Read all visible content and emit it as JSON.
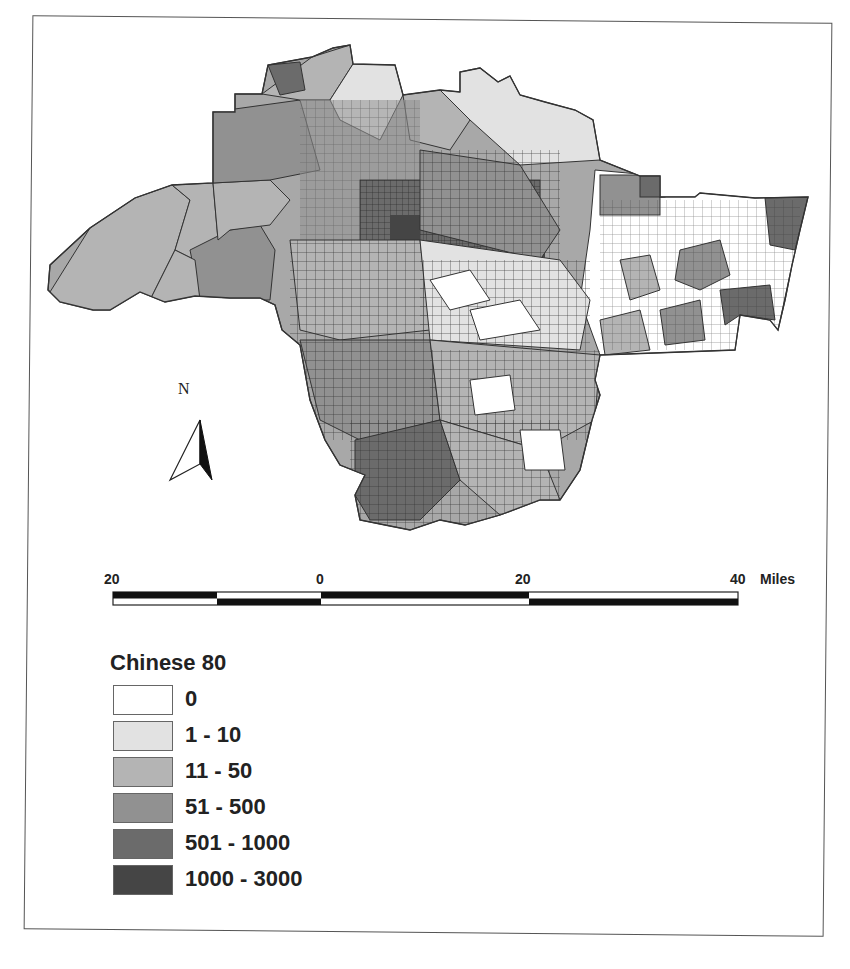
{
  "map": {
    "region": "Los Angeles County census tracts",
    "north_arrow": {
      "label": "N"
    },
    "scale_bar": {
      "ticks": [
        "20",
        "0",
        "20",
        "40"
      ],
      "unit": "Miles"
    }
  },
  "legend": {
    "title": "Chinese 80",
    "classes": [
      {
        "label": "0",
        "color": "#ffffff"
      },
      {
        "label": "1 - 10",
        "color": "#e2e2e2"
      },
      {
        "label": "11 - 50",
        "color": "#b4b4b4"
      },
      {
        "label": "51 - 500",
        "color": "#919191"
      },
      {
        "label": "501 - 1000",
        "color": "#6b6b6b"
      },
      {
        "label": "1000 - 3000",
        "color": "#454545"
      }
    ]
  },
  "colors": {
    "frame": "#555555",
    "tract_border": "#333333",
    "text": "#222222"
  }
}
